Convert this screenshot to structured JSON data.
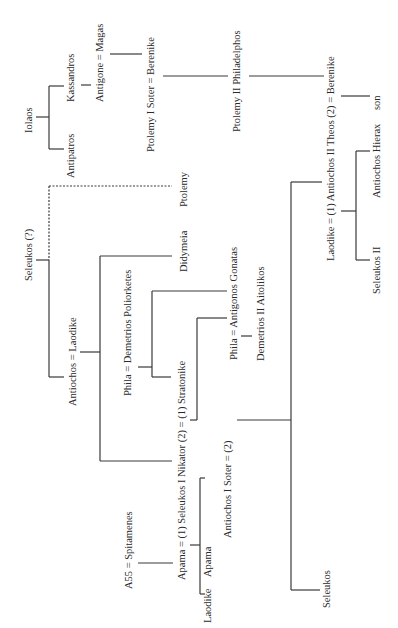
{
  "colors": {
    "line": "#3a3a3a",
    "text": "#2a2a2a",
    "background": "#ffffff"
  },
  "people": {
    "iolaos": "Iolaos",
    "antipatros": "Antipatros",
    "kassandros": "Kassandros",
    "antigone_magas": "Antigone = Magas",
    "ptolemy_i": "Ptolemy I Soter = Berenike",
    "ptolemy_ii": "Ptolemy II Philadelphos",
    "antiochos_ii_berenike": "Laodike = (1) Antiochos II Theos (2) = Berenike",
    "son": "son",
    "antiochos_hierax": "Antiochos Hierax",
    "seleukos_ii": "Seleukos II",
    "seleukos_q": "Seleukos (?)",
    "ptolemy": "Ptolemy",
    "didymeia": "Didymeia",
    "antiochos_laodike": "Antiochos = Laodike",
    "phila_demetrios": "Phila = Demetrios Poliorketes",
    "phila_antigonos": "Phila = Antigonos Gonatas",
    "demetrios_ii": "Demetrios II Aitolikos",
    "seleukos_i": "Apama = (1) Seleukos I Nikator (2) = (1) Stratonike",
    "antiochos_i": "Antiochos I Soter = (2)",
    "a55_spitamenes": "A55 = Spitamenes",
    "laodike_child": "Laodike",
    "apama_child": "Apama",
    "seleukos_child": "Seleukos"
  }
}
